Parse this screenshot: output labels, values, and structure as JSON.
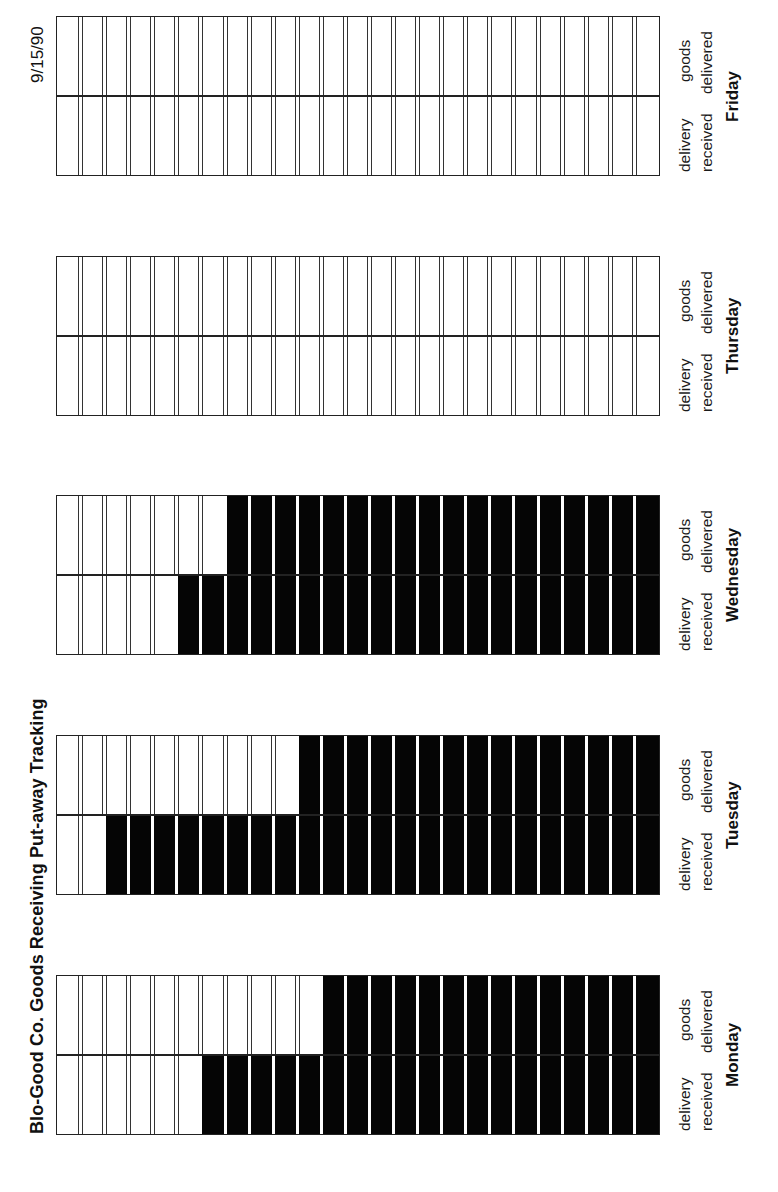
{
  "title": "Blo-Good Co.  Goods Receiving Put-away Tracking",
  "date": "9/15/90",
  "columns_per_row": 25,
  "row_labels": {
    "delivery_line1": "delivery",
    "delivery_line2": "received",
    "goods_line1": "goods",
    "goods_line2": "delivered"
  },
  "days": [
    {
      "name": "Friday",
      "delivery_received_filled": 0,
      "goods_delivered_filled": 0
    },
    {
      "name": "Thursday",
      "delivery_received_filled": 0,
      "goods_delivered_filled": 0
    },
    {
      "name": "Wednesday",
      "delivery_received_filled": 20,
      "goods_delivered_filled": 18
    },
    {
      "name": "Tuesday",
      "delivery_received_filled": 23,
      "goods_delivered_filled": 15
    },
    {
      "name": "Monday",
      "delivery_received_filled": 19,
      "goods_delivered_filled": 14
    }
  ],
  "colors": {
    "filled": "#050505",
    "empty": "#ffffff",
    "grid": "#222222"
  },
  "chart_data": {
    "type": "table",
    "title": "Blo-Good Co.  Goods Receiving Put-away Tracking",
    "subtitle": "9/15/90",
    "categories": [
      "Monday",
      "Tuesday",
      "Wednesday",
      "Thursday",
      "Friday"
    ],
    "total_slots": 25,
    "series": [
      {
        "name": "delivery received",
        "values": [
          19,
          23,
          20,
          0,
          0
        ]
      },
      {
        "name": "goods delivered",
        "values": [
          14,
          15,
          18,
          0,
          0
        ]
      }
    ],
    "xlabel": "",
    "ylabel": "",
    "orientation": "rotated 90° counter-clockwise (page landscape printed on portrait)",
    "grid": true,
    "legend": "row labels beside each day block"
  }
}
